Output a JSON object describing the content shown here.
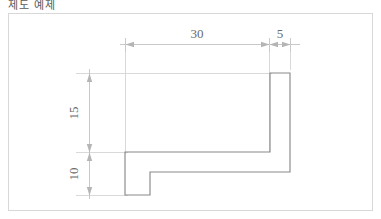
{
  "title": "제도 예제",
  "drawing": {
    "frame_color": "#d8d8d8",
    "outline_color": "#7a7a7a",
    "dimension_color": "#b9b9b9",
    "text_color": "#6b6b6b",
    "dimensions": [
      {
        "id": "width-30",
        "label": "30",
        "orientation": "horizontal",
        "value": 30,
        "unit": "mm"
      },
      {
        "id": "width-5",
        "label": "5",
        "orientation": "horizontal",
        "value": 5,
        "unit": "mm"
      },
      {
        "id": "height-15",
        "label": "15",
        "orientation": "vertical",
        "value": 15,
        "unit": "mm"
      },
      {
        "id": "height-10",
        "label": "10",
        "orientation": "vertical",
        "value": 10,
        "unit": "mm"
      }
    ],
    "shape": {
      "type": "polyline-profile",
      "description": "stepped L-profile cross section",
      "points": "270,73 290,73 290,172 150,172 150,195 125,195 125,152 270,152 270,73"
    }
  }
}
